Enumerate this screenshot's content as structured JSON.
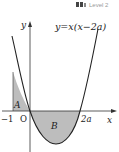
{
  "figure": {
    "equation": "y=x(x−2a)",
    "axis_x_label": "x",
    "axis_y_label": "y",
    "origin_label": "O",
    "tick_left": "−1",
    "tick_right": "2a",
    "region_a_label": "A",
    "region_b_label": "B",
    "watermark": "Level 2",
    "colors": {
      "shade": "#bdbdbd",
      "curve": "#222222",
      "axis": "#333333"
    }
  }
}
